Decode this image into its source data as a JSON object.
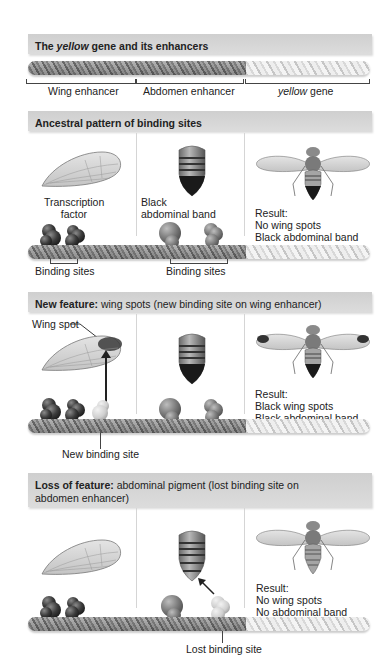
{
  "panels": [
    {
      "id": "structure",
      "title_bold": "The ",
      "title_italic": "yellow",
      "title_rest": " gene and its enhancers",
      "regions": [
        {
          "label": "Wing enhancer",
          "italic": false
        },
        {
          "label": "Abdomen enhancer",
          "italic": false
        },
        {
          "label_italic": "yellow",
          "label_rest": " gene"
        }
      ]
    },
    {
      "id": "ancestral",
      "title_bold": "Ancestral pattern of binding sites",
      "labels": {
        "transcription_factor_1": "Transcription",
        "transcription_factor_2": "factor",
        "black_1": "Black",
        "black_2": "abdominal band",
        "binding_sites_wing": "Binding sites",
        "binding_sites_abdomen": "Binding sites"
      },
      "result": [
        "Result:",
        "No wing spots",
        "Black abdominal band"
      ]
    },
    {
      "id": "new-feature",
      "title_bold": "New feature:",
      "title_rest": " wing spots (new binding site on wing enhancer)",
      "labels": {
        "wing_spot": "Wing spot",
        "new_binding_site": "New binding site"
      },
      "result": [
        "Result:",
        "Black wing spots",
        "Black abdominal band"
      ]
    },
    {
      "id": "loss-feature",
      "title_bold": "Loss of feature:",
      "title_rest": " abdominal pigment (lost binding site on",
      "title_line2": "abdomen enhancer)",
      "labels": {
        "lost_binding_site": "Lost binding site"
      },
      "result": [
        "Result:",
        "No wing spots",
        "No abdominal band"
      ]
    }
  ],
  "colors": {
    "header_bg": "#d6d6d6",
    "tf_dark": "#3a3a3a",
    "tf_mid": "#7a7a7a",
    "tf_light": "#cfcfcf",
    "separator": "#d5d5d5"
  }
}
